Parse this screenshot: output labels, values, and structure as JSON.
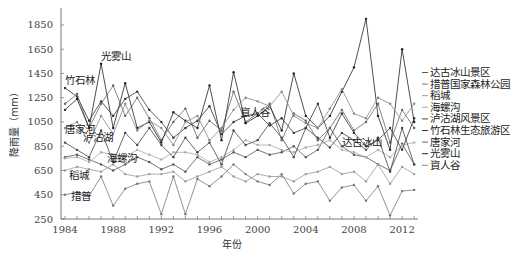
{
  "chart_data": {
    "type": "line",
    "title": "",
    "xlabel": "年份",
    "ylabel": "降雨量（mm）",
    "xlim": [
      1984,
      2013
    ],
    "ylim": [
      250,
      1950
    ],
    "x_ticks": [
      "1984",
      "1988",
      "1992",
      "1996",
      "2000",
      "2004",
      "2008",
      "2012"
    ],
    "y_ticks": [
      "250",
      "450",
      "650",
      "850",
      "1050",
      "1250",
      "1450",
      "1650",
      "1850"
    ],
    "grid": false,
    "legend_position": "right",
    "x": [
      1984,
      1985,
      1986,
      1987,
      1988,
      1989,
      1990,
      1991,
      1992,
      1993,
      1994,
      1995,
      1996,
      1997,
      1998,
      1999,
      2000,
      2001,
      2002,
      2003,
      2004,
      2005,
      2006,
      2007,
      2008,
      2009,
      2010,
      2011,
      2012,
      2013
    ],
    "series": [
      {
        "name": "达古冰山景区",
        "color": "#555555",
        "values": [
          760,
          780,
          740,
          700,
          650,
          700,
          760,
          720,
          660,
          700,
          640,
          760,
          700,
          740,
          800,
          760,
          820,
          780,
          800,
          850,
          760,
          820,
          1000,
          850,
          780,
          760,
          700,
          650,
          870,
          700
        ]
      },
      {
        "name": "措普国家森林公园",
        "color": "#777777",
        "values": [
          450,
          470,
          440,
          600,
          360,
          500,
          540,
          560,
          290,
          600,
          290,
          580,
          520,
          600,
          700,
          620,
          560,
          530,
          620,
          460,
          540,
          560,
          400,
          510,
          530,
          400,
          520,
          280,
          480,
          490
        ]
      },
      {
        "name": "稻城",
        "color": "#999999",
        "values": [
          650,
          680,
          660,
          640,
          700,
          620,
          600,
          620,
          620,
          640,
          560,
          600,
          640,
          680,
          600,
          560,
          620,
          600,
          600,
          560,
          620,
          640,
          680,
          620,
          640,
          560,
          700,
          540,
          680,
          620
        ]
      },
      {
        "name": "海螺沟",
        "color": "#aaaaaa",
        "values": [
          750,
          760,
          720,
          800,
          780,
          760,
          820,
          780,
          740,
          800,
          800,
          780,
          720,
          760,
          820,
          900,
          860,
          860,
          820,
          800,
          840,
          860,
          900,
          820,
          800,
          760,
          820,
          760,
          860,
          880
        ]
      },
      {
        "name": "泸沽湖风景区",
        "color": "#444444",
        "values": [
          880,
          820,
          760,
          980,
          720,
          960,
          860,
          1000,
          860,
          760,
          920,
          800,
          880,
          700,
          980,
          860,
          900,
          1040,
          920,
          760,
          1000,
          920,
          840,
          960,
          900,
          820,
          920,
          640,
          1000,
          700
        ]
      },
      {
        "name": "竹石林生态旅游区",
        "color": "#333333",
        "values": [
          1330,
          1260,
          1060,
          1220,
          1100,
          1240,
          1300,
          1150,
          1050,
          920,
          1000,
          1060,
          1180,
          950,
          1050,
          1100,
          1120,
          1020,
          1080,
          960,
          1000,
          1200,
          920,
          1120,
          960,
          850,
          900,
          1000,
          820,
          1080
        ]
      },
      {
        "name": "唐家河",
        "color": "#666666",
        "values": [
          1200,
          1280,
          1000,
          1200,
          1350,
          1100,
          1250,
          1080,
          900,
          1050,
          1160,
          920,
          1060,
          980,
          1300,
          1050,
          1120,
          1200,
          900,
          1120,
          1060,
          900,
          1000,
          1150,
          980,
          1050,
          1200,
          880,
          1150,
          1000
        ]
      },
      {
        "name": "光雾山",
        "color": "#222222",
        "values": [
          1150,
          1240,
          1000,
          1530,
          1000,
          1370,
          1000,
          1050,
          880,
          1130,
          1060,
          1000,
          1350,
          900,
          1460,
          1040,
          1100,
          1180,
          980,
          1450,
          1100,
          1000,
          1100,
          1300,
          1500,
          1900,
          1100,
          820,
          1650,
          1050
        ]
      },
      {
        "name": "資人谷",
        "color": "#888888",
        "values": [
          1000,
          1050,
          880,
          1100,
          950,
          1200,
          980,
          1060,
          1000,
          860,
          1050,
          1100,
          900,
          1000,
          1150,
          1250,
          1220,
          1180,
          1300,
          1100,
          1040,
          1000,
          1160,
          1320,
          1120,
          1080,
          1250,
          1200,
          1060,
          1200
        ]
      }
    ],
    "annotations": [
      {
        "text": "光雾山",
        "x": 1987,
        "y": 1560
      },
      {
        "text": "竹石林",
        "x": 1984,
        "y": 1360
      },
      {
        "text": "唐家河",
        "x": 1984,
        "y": 960
      },
      {
        "text": "泸沽湖",
        "x": 1985.5,
        "y": 890
      },
      {
        "text": "稻城",
        "x": 1984.3,
        "y": 580
      },
      {
        "text": "措普",
        "x": 1984.5,
        "y": 410
      },
      {
        "text": "海螺沟",
        "x": 1987.5,
        "y": 720
      },
      {
        "text": "資人谷",
        "x": 1998.5,
        "y": 1100
      },
      {
        "text": "达古冰山",
        "x": 2007,
        "y": 850
      }
    ]
  },
  "axes": {
    "xlabel": "年份",
    "ylabel": "降雨量（mm）"
  }
}
